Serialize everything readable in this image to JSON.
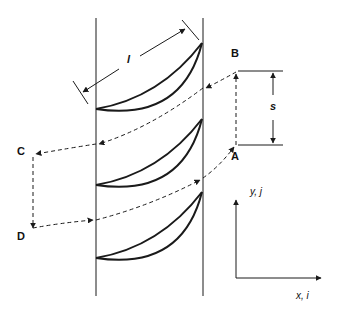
{
  "figure": {
    "type": "blade-cascade-periodic-boundary-diagram",
    "colors": {
      "line": "#1a1a1a",
      "background": "#ffffff"
    }
  },
  "labels": {
    "chord": "l",
    "pitch": "s",
    "point_a": "A",
    "point_b": "B",
    "point_c": "C",
    "point_d": "D",
    "y_axis": "y, j",
    "x_axis": "x, i"
  },
  "blades": [
    {
      "name": "blade-1",
      "leading_edge": [
        96,
        109
      ],
      "trailing_edge": [
        202,
        43
      ]
    },
    {
      "name": "blade-2",
      "leading_edge": [
        96,
        185
      ],
      "trailing_edge": [
        202,
        119
      ]
    },
    {
      "name": "blade-3",
      "leading_edge": [
        96,
        258
      ],
      "trailing_edge": [
        202,
        192
      ]
    }
  ]
}
